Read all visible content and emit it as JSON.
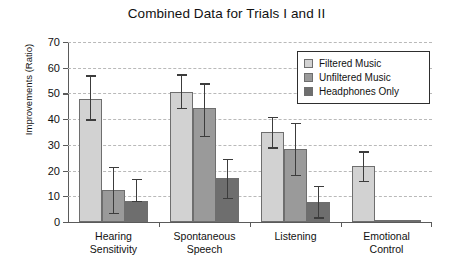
{
  "chart_data": {
    "type": "bar",
    "title": "Combined Data for Trials I and II",
    "xlabel": "",
    "ylabel": "Improvements (Ratio)",
    "ylim": [
      0,
      70
    ],
    "ytick_labels": [
      "0",
      "10",
      "20",
      "30",
      "40",
      "50",
      "60",
      "70"
    ],
    "ytick_values": [
      0,
      10,
      20,
      30,
      40,
      50,
      60,
      70
    ],
    "grid": "horizontal-dashed",
    "legend_position": "top-right-inside",
    "categories": [
      "Hearing Sensitivity",
      "Spontaneous Speech",
      "Listening",
      "Emotional Control"
    ],
    "category_lines": [
      [
        "Hearing",
        "Sensitivity"
      ],
      [
        "Spontaneous",
        "Speech"
      ],
      [
        "Listening",
        ""
      ],
      [
        "Emotional",
        "Control"
      ]
    ],
    "series": [
      {
        "name": "Filtered Music",
        "color": "#d2d2d2",
        "values": [
          48.0,
          50.5,
          35.0,
          21.8
        ],
        "err_low": [
          40.0,
          44.5,
          29.0,
          16.0
        ],
        "err_high": [
          57.0,
          57.5,
          41.0,
          27.5
        ]
      },
      {
        "name": "Unfiltered Music",
        "color": "#9a9a9a",
        "values": [
          12.5,
          44.2,
          28.4,
          0.9
        ],
        "err_low": [
          3.5,
          33.5,
          18.3,
          0.9
        ],
        "err_high": [
          21.5,
          54.0,
          38.5,
          0.9
        ]
      },
      {
        "name": "Headphones Only",
        "color": "#6e6e6e",
        "values": [
          8.2,
          17.2,
          7.9,
          0.9
        ],
        "err_low": [
          8.2,
          9.3,
          1.9,
          0.9
        ],
        "err_high": [
          16.7,
          24.5,
          14.0,
          0.9
        ]
      }
    ]
  },
  "legend": {
    "items": [
      {
        "label": "Filtered Music",
        "color": "#d2d2d2"
      },
      {
        "label": "Unfiltered Music",
        "color": "#9a9a9a"
      },
      {
        "label": "Headphones Only",
        "color": "#6e6e6e"
      }
    ]
  }
}
